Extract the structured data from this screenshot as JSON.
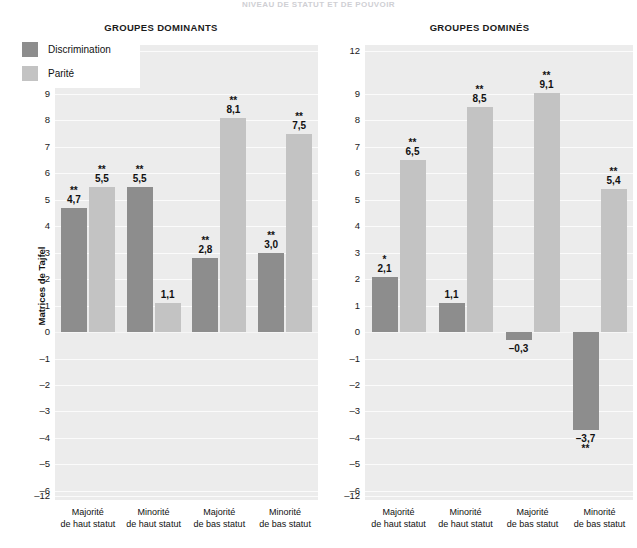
{
  "running_head": "NIVEAU DE STATUT ET DE POUVOIR",
  "axis": {
    "ylabel": "Matrices de Tajfel",
    "ticks": [
      "12",
      "9",
      "8",
      "7",
      "6",
      "5",
      "4",
      "3",
      "2",
      "1",
      "0",
      "–1",
      "–2",
      "–3",
      "–4",
      "–5",
      "–6",
      "–12"
    ]
  },
  "legend": {
    "items": [
      {
        "label": "Discrimination",
        "color": "#8d8d8d"
      },
      {
        "label": "Parité",
        "color": "#c3c3c3"
      }
    ]
  },
  "chart_data": [
    {
      "type": "bar",
      "title": "GROUPES DOMINANTS",
      "xlabel": "",
      "ylabel": "Matrices de Tajfel",
      "ylim": [
        -12,
        12
      ],
      "grid": true,
      "legend_position": "top-left",
      "categories": [
        "Majorité de haut statut",
        "Minorité de haut statut",
        "Majorité de bas statut",
        "Minorité de bas statut"
      ],
      "category_lines": [
        [
          "Majorité",
          "de haut statut"
        ],
        [
          "Minorité",
          "de haut statut"
        ],
        [
          "Majorité",
          "de bas statut"
        ],
        [
          "Minorité",
          "de bas statut"
        ]
      ],
      "series": [
        {
          "name": "Discrimination",
          "color": "#8d8d8d",
          "values": [
            4.7,
            5.5,
            2.8,
            3.0
          ],
          "labels": [
            "4,7",
            "5,5",
            "2,8",
            "3,0"
          ],
          "significance": [
            "**",
            "**",
            "**",
            "**"
          ]
        },
        {
          "name": "Parité",
          "color": "#c3c3c3",
          "values": [
            5.5,
            1.1,
            8.1,
            7.5
          ],
          "labels": [
            "5,5",
            "1,1",
            "8,1",
            "7,5"
          ],
          "significance": [
            "**",
            "",
            "**",
            "**"
          ]
        }
      ]
    },
    {
      "type": "bar",
      "title": "GROUPES DOMINÉS",
      "xlabel": "",
      "ylabel": "",
      "ylim": [
        -12,
        12
      ],
      "grid": true,
      "legend_position": "none",
      "categories": [
        "Majorité de haut statut",
        "Minorité de haut statut",
        "Majorité de bas statut",
        "Minorité de bas statut"
      ],
      "category_lines": [
        [
          "Majorité",
          "de haut statut"
        ],
        [
          "Minorité",
          "de haut statut"
        ],
        [
          "Majorité",
          "de bas statut"
        ],
        [
          "Minorité",
          "de bas statut"
        ]
      ],
      "series": [
        {
          "name": "Discrimination",
          "color": "#8d8d8d",
          "values": [
            2.1,
            1.1,
            -0.3,
            -3.7
          ],
          "labels": [
            "2,1",
            "1,1",
            "–0,3",
            "–3,7"
          ],
          "significance": [
            "*",
            "",
            "",
            "**"
          ]
        },
        {
          "name": "Parité",
          "color": "#c3c3c3",
          "values": [
            6.5,
            8.5,
            9.1,
            5.4
          ],
          "labels": [
            "6,5",
            "8,5",
            "9,1",
            "5,4"
          ],
          "significance": [
            "**",
            "**",
            "**",
            "**"
          ]
        }
      ]
    }
  ]
}
